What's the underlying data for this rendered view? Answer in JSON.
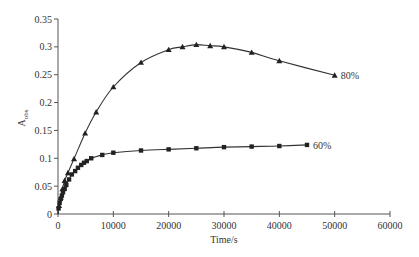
{
  "chart_data": {
    "type": "scatter",
    "title": "",
    "xlabel": "Time/s",
    "ylabel": "A",
    "ylabel_subscript": "obs",
    "xlim": [
      0,
      60000
    ],
    "ylim": [
      0,
      0.35
    ],
    "x_ticks": [
      0,
      10000,
      20000,
      30000,
      40000,
      50000,
      60000
    ],
    "x_tick_labels": [
      "0",
      "10000",
      "20000",
      "30000",
      "40000",
      "50000",
      "60000"
    ],
    "y_ticks": [
      0,
      0.05,
      0.1,
      0.15,
      0.2,
      0.25,
      0.3,
      0.35
    ],
    "y_tick_labels": [
      "0",
      "0.05",
      "0.1",
      "0.15",
      "0.2",
      "0.25",
      "0.3",
      "0.35"
    ],
    "grid": false,
    "legend_position": "inline-right-of-series",
    "series": [
      {
        "name": "80%",
        "marker": "triangle",
        "color": "#222222",
        "fit_curve": true,
        "x": [
          200,
          500,
          800,
          1200,
          1800,
          2900,
          4900,
          6900,
          10000,
          15000,
          20000,
          22500,
          25000,
          27500,
          30000,
          35000,
          40000,
          50000
        ],
        "y": [
          0.015,
          0.03,
          0.045,
          0.06,
          0.074,
          0.099,
          0.145,
          0.183,
          0.228,
          0.272,
          0.295,
          0.3,
          0.304,
          0.302,
          0.3,
          0.29,
          0.275,
          0.249
        ]
      },
      {
        "name": "60%",
        "marker": "square",
        "color": "#222222",
        "fit_curve": true,
        "x": [
          100,
          300,
          500,
          700,
          900,
          1200,
          1500,
          2000,
          2500,
          3100,
          3600,
          4200,
          4700,
          5200,
          6000,
          8000,
          10000,
          15000,
          20000,
          25000,
          30000,
          35000,
          40000,
          45000
        ],
        "y": [
          0.01,
          0.02,
          0.027,
          0.033,
          0.039,
          0.045,
          0.052,
          0.062,
          0.071,
          0.077,
          0.083,
          0.088,
          0.092,
          0.095,
          0.1,
          0.106,
          0.11,
          0.114,
          0.116,
          0.118,
          0.12,
          0.121,
          0.122,
          0.124
        ]
      }
    ]
  }
}
